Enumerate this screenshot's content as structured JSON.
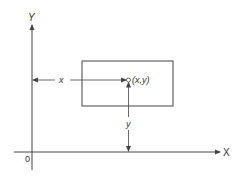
{
  "diagram": {
    "axes": {
      "x_label": "X",
      "y_label": "Y",
      "origin_label": "0"
    },
    "point": {
      "label": "(x,y)"
    },
    "dimensions": {
      "horizontal_label": "x",
      "vertical_label": "y"
    },
    "colors": {
      "line": "#444444",
      "background": "#ffffff"
    }
  }
}
